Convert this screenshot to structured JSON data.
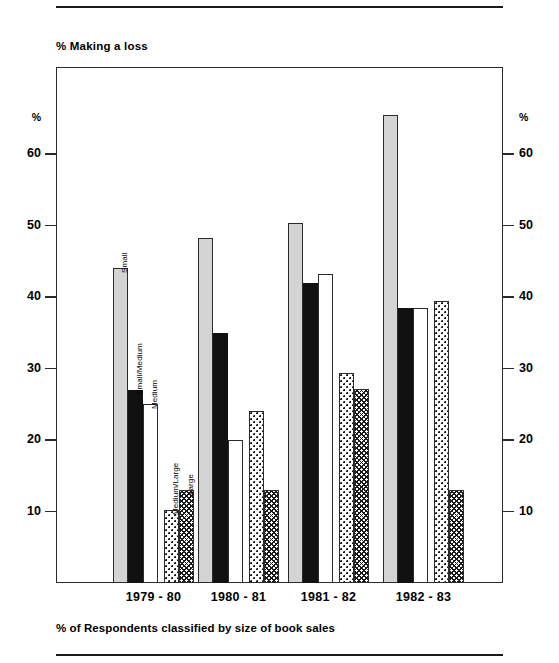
{
  "chart_data": {
    "type": "bar",
    "title": "% Making a loss",
    "xlabel": "% of Respondents classified by size of book sales",
    "ylabel": "%",
    "ylim": [
      0,
      65
    ],
    "grid": false,
    "legend_position": "in-plot-rotated-labels",
    "categories": [
      "1979 - 80",
      "1980 - 81",
      "1981 - 82",
      "1982 - 83"
    ],
    "series": [
      {
        "name": "Small",
        "values": [
          44.0,
          48.3,
          50.3,
          65.4
        ]
      },
      {
        "name": "Small/Medium",
        "values": [
          27.0,
          35.0,
          42.0,
          38.4
        ]
      },
      {
        "name": "Medium",
        "values": [
          25.0,
          20.0,
          43.2,
          38.5
        ]
      },
      {
        "name": "Medium/Large",
        "values": [
          10.2,
          24.0,
          29.4,
          39.5
        ]
      },
      {
        "name": "Large",
        "values": [
          13.0,
          13.0,
          27.2,
          13.0
        ]
      }
    ],
    "yticks": [
      60,
      50,
      40,
      30,
      20,
      10
    ],
    "ytick_labels_left": [
      "60",
      "50",
      "40",
      "30",
      "20",
      "10"
    ],
    "ytick_labels_right": [
      "60",
      "50",
      "40",
      "30",
      "20",
      "10"
    ],
    "axis_unit_left": "%",
    "axis_unit_right": "%",
    "series_colors": {
      "Small": "#d4d4d4",
      "Small/Medium": "#111111",
      "Medium": "#ffffff",
      "Medium/Large": "#ffffff",
      "Large": "#ffffff"
    },
    "annotations": [
      {
        "text": "Small",
        "group": "1979 - 80"
      },
      {
        "text": "Small/Medium",
        "group": "1979 - 80"
      },
      {
        "text": "Medium",
        "group": "1979 - 80"
      },
      {
        "text": "Medium/Large",
        "group": "1979 - 80"
      },
      {
        "text": "Large",
        "group": "1979 - 80"
      }
    ]
  }
}
